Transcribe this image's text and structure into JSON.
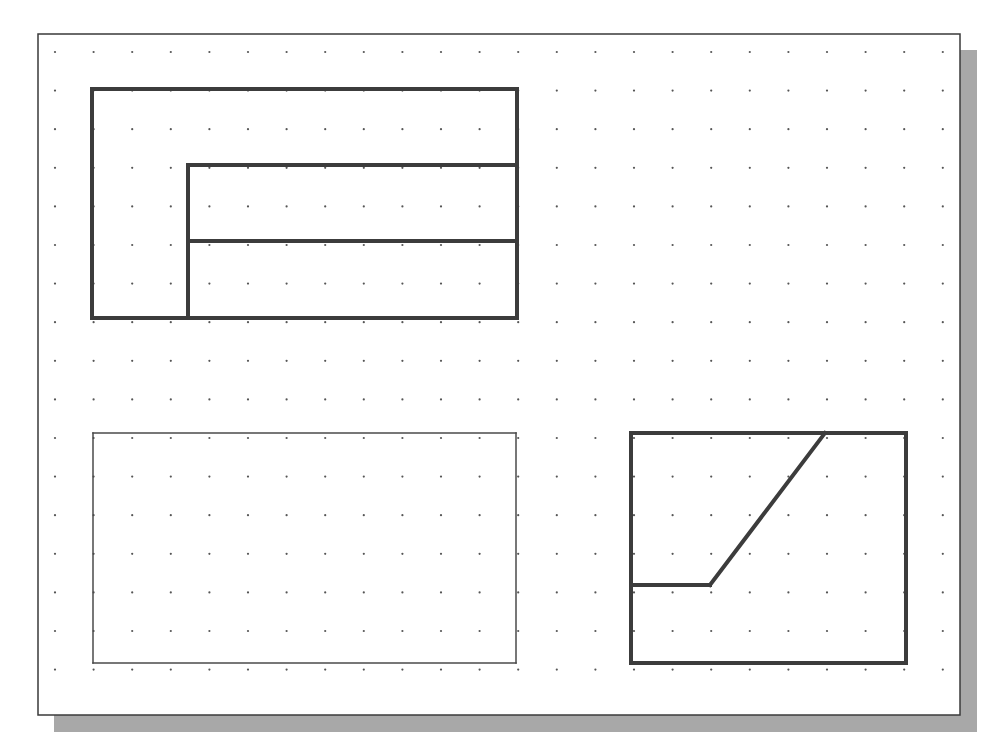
{
  "colors": {
    "background": "#ffffff",
    "sheet": "#ffffff",
    "sheet_border": "#3a3a3a",
    "shadow": "#a8a8a8",
    "grid_dot": "#555555",
    "line_thick": "#3c3c3c",
    "line_thin": "#4a4a4a"
  },
  "sheet": {
    "x": 38,
    "y": 34,
    "width": 922,
    "height": 681,
    "shadow_offset": 16
  },
  "grid": {
    "origin_x": 55,
    "origin_y": 52,
    "spacing": 38.6,
    "cols": 24,
    "rows": 17,
    "dot_radius": 1.1
  },
  "drawings": [
    {
      "name": "top-view-outline",
      "stroke": "thick",
      "segments": [
        [
          92,
          89,
          517,
          89
        ],
        [
          517,
          89,
          517,
          318
        ],
        [
          517,
          318,
          92,
          318
        ],
        [
          92,
          318,
          92,
          89
        ]
      ]
    },
    {
      "name": "top-view-inner-lines",
      "stroke": "thick",
      "segments": [
        [
          188,
          165,
          517,
          165
        ],
        [
          188,
          165,
          188,
          318
        ],
        [
          188,
          241,
          517,
          241
        ]
      ]
    },
    {
      "name": "front-view-outline",
      "stroke": "thin",
      "segments": [
        [
          93,
          433,
          516,
          433
        ],
        [
          516,
          433,
          516,
          663
        ],
        [
          516,
          663,
          93,
          663
        ],
        [
          93,
          663,
          93,
          433
        ]
      ]
    },
    {
      "name": "side-view-outline",
      "stroke": "thick",
      "segments": [
        [
          631,
          433,
          906,
          433
        ],
        [
          906,
          433,
          906,
          663
        ],
        [
          906,
          663,
          631,
          663
        ],
        [
          631,
          663,
          631,
          433
        ]
      ]
    },
    {
      "name": "side-view-inner-lines",
      "stroke": "thick",
      "segments": [
        [
          631,
          585,
          710,
          585
        ],
        [
          710,
          585,
          825,
          433
        ]
      ]
    }
  ]
}
